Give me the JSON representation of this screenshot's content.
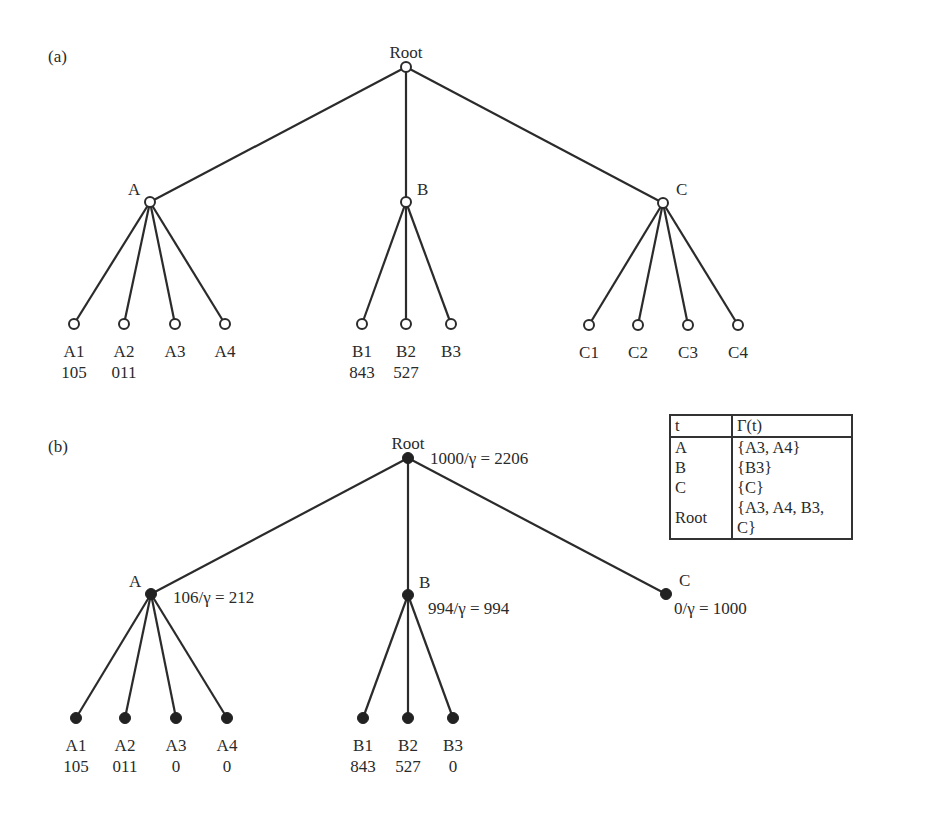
{
  "panel_a": {
    "label": "(a)",
    "nodes": {
      "root": {
        "label": "Root",
        "x": 406,
        "y": 67
      },
      "A": {
        "label": "A",
        "x": 150,
        "y": 202
      },
      "B": {
        "label": "B",
        "x": 406,
        "y": 202
      },
      "C": {
        "label": "C",
        "x": 663,
        "y": 203
      }
    },
    "leaves": [
      {
        "label": "A1",
        "value": "105",
        "parent": "A",
        "x": 74,
        "y": 324
      },
      {
        "label": "A2",
        "value": "011",
        "parent": "A",
        "x": 124,
        "y": 324
      },
      {
        "label": "A3",
        "value": "",
        "parent": "A",
        "x": 175,
        "y": 324
      },
      {
        "label": "A4",
        "value": "",
        "parent": "A",
        "x": 225,
        "y": 324
      },
      {
        "label": "B1",
        "value": "843",
        "parent": "B",
        "x": 362,
        "y": 324
      },
      {
        "label": "B2",
        "value": "527",
        "parent": "B",
        "x": 406,
        "y": 324
      },
      {
        "label": "B3",
        "value": "",
        "parent": "B",
        "x": 451,
        "y": 324
      },
      {
        "label": "C1",
        "value": "",
        "parent": "C",
        "x": 589,
        "y": 325
      },
      {
        "label": "C2",
        "value": "",
        "parent": "C",
        "x": 638,
        "y": 325
      },
      {
        "label": "C3",
        "value": "",
        "parent": "C",
        "x": 688,
        "y": 325
      },
      {
        "label": "C4",
        "value": "",
        "parent": "C",
        "x": 738,
        "y": 325
      }
    ]
  },
  "panel_b": {
    "label": "(b)",
    "nodes": {
      "root": {
        "label": "Root",
        "annotation": "1000/γ = 2206",
        "x": 408,
        "y": 458
      },
      "A": {
        "label": "A",
        "annotation": "106/γ = 212",
        "x": 151,
        "y": 594
      },
      "B": {
        "label": "B",
        "annotation": "994/γ = 994",
        "x": 408,
        "y": 595
      },
      "C": {
        "label": "C",
        "annotation": "0/γ = 1000",
        "x": 666,
        "y": 594
      }
    },
    "leaves": [
      {
        "label": "A1",
        "value": "105",
        "parent": "A",
        "x": 76,
        "y": 718
      },
      {
        "label": "A2",
        "value": "011",
        "parent": "A",
        "x": 125,
        "y": 718
      },
      {
        "label": "A3",
        "value": "0",
        "parent": "A",
        "x": 176,
        "y": 718
      },
      {
        "label": "A4",
        "value": "0",
        "parent": "A",
        "x": 227,
        "y": 718
      },
      {
        "label": "B1",
        "value": "843",
        "parent": "B",
        "x": 363,
        "y": 718
      },
      {
        "label": "B2",
        "value": "527",
        "parent": "B",
        "x": 408,
        "y": 718
      },
      {
        "label": "B3",
        "value": "0",
        "parent": "B",
        "x": 453,
        "y": 718
      }
    ],
    "table": {
      "headers": [
        "t",
        "Γ(t)"
      ],
      "rows": [
        [
          "A",
          "{A3, A4}"
        ],
        [
          "B",
          "{B3}"
        ],
        [
          "C",
          "{C}"
        ],
        [
          "Root",
          "{A3, A4, B3, C}"
        ]
      ]
    }
  }
}
